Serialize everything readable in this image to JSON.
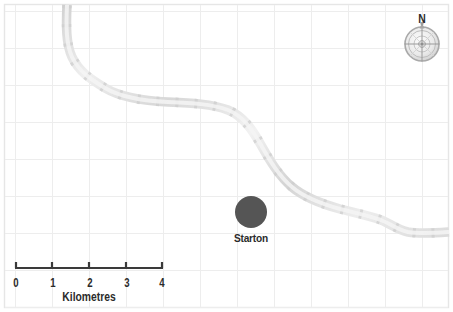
{
  "map": {
    "background_color": "#ffffff",
    "border_color": "#e9e9e9",
    "grid": {
      "visible": true,
      "color": "#ececec",
      "spacing_px": 37,
      "origin_x": 15,
      "origin_y": 11
    },
    "features": {
      "river": {
        "name": "river",
        "color": "#e2e2e2",
        "stroke_width": 9,
        "enters_top_x": 67,
        "exits_right_y": 232
      },
      "settlement": {
        "name": "Starton",
        "label": "Starton",
        "marker_shape": "circle",
        "marker_color": "#555555",
        "marker_radius_px": 16,
        "center_x": 251,
        "center_y": 212
      }
    },
    "compass": {
      "north_label": "N",
      "center_x": 422,
      "center_y": 44,
      "radius_px": 17,
      "color": "#b0b0b0"
    },
    "scale_bar": {
      "caption": "Kilometres",
      "unit": "Kilometres",
      "ticks": [
        "0",
        "1",
        "2",
        "3",
        "4"
      ],
      "tick_values": [
        0,
        1,
        2,
        3,
        4
      ],
      "bar_color": "#3a3a3a",
      "start_x": 15,
      "end_x": 163,
      "baseline_y": 268
    }
  }
}
